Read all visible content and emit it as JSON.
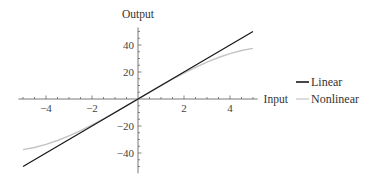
{
  "chart_data": {
    "type": "line",
    "title": "",
    "xlabel": "Input",
    "ylabel": "Output",
    "xlim": [
      -5.2,
      5.2
    ],
    "ylim": [
      -55,
      53
    ],
    "grid": false,
    "legend_position": "right",
    "x_ticks": [
      -4,
      -2,
      2,
      4
    ],
    "x_tick_labels": [
      "−4",
      "−2",
      "2",
      "4"
    ],
    "x_minor_step": 0.5,
    "y_ticks": [
      -40,
      -20,
      20,
      40
    ],
    "y_tick_labels": [
      "−40",
      "−20",
      "20",
      "40"
    ],
    "y_minor_step": 5,
    "series": [
      {
        "name": "Linear",
        "color": "#1a1a1a",
        "x": [
          -5,
          -4,
          -3,
          -2,
          -1,
          0,
          1,
          2,
          3,
          4,
          5
        ],
        "values": [
          -50,
          -40,
          -30,
          -20,
          -10,
          0,
          10,
          20,
          30,
          40,
          50
        ]
      },
      {
        "name": "Nonlinear",
        "color": "#c4c4c4",
        "x": [
          -5,
          -4.5,
          -4,
          -3.5,
          -3,
          -2.5,
          -2,
          -1.5,
          -1,
          -0.5,
          0,
          0.5,
          1,
          1.5,
          2,
          2.5,
          3,
          3.5,
          4,
          4.5,
          5
        ],
        "values": [
          -37.5,
          -35.9,
          -33.6,
          -30.7,
          -27.3,
          -23.4,
          -19.2,
          -14.7,
          -9.9,
          -5.0,
          0,
          5.0,
          9.9,
          14.7,
          19.2,
          23.4,
          27.3,
          30.7,
          33.6,
          35.9,
          37.5
        ]
      }
    ]
  }
}
